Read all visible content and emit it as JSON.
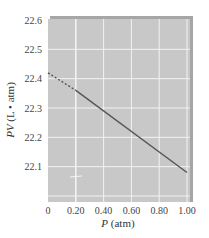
{
  "chart_data": {
    "type": "line",
    "title": "",
    "xlabel": "P (atm)",
    "xlabel_var": "P",
    "xlabel_unit": " (atm)",
    "ylabel": "PV (L • atm)",
    "ylabel_var": "PV",
    "ylabel_unit": " (L • atm)",
    "xlim": [
      0,
      1.0
    ],
    "ylim": [
      22.0,
      22.6
    ],
    "x_ticks": [
      0,
      0.2,
      0.4,
      0.6,
      0.8,
      1.0
    ],
    "x_tick_labels": [
      "0",
      "0.20",
      "0.40",
      "0.60",
      "0.80",
      "1.00"
    ],
    "y_ticks": [
      22.1,
      22.2,
      22.3,
      22.4,
      22.5,
      22.6
    ],
    "y_tick_labels": [
      "22.1",
      "22.2",
      "22.3",
      "22.4",
      "22.5",
      "22.6"
    ],
    "grid": true,
    "legend": false,
    "series": [
      {
        "name": "extrapolated",
        "style": "dashed",
        "x": [
          0,
          0.2
        ],
        "y": [
          22.42,
          22.36
        ]
      },
      {
        "name": "measured",
        "style": "solid",
        "x": [
          0.2,
          1.0
        ],
        "y": [
          22.36,
          22.08
        ]
      }
    ],
    "colors": {
      "plot_background": "#c8c8c8",
      "grid": "#f2f2f2",
      "line": "#555555",
      "frame_shadow": "#9e9e9e"
    }
  }
}
